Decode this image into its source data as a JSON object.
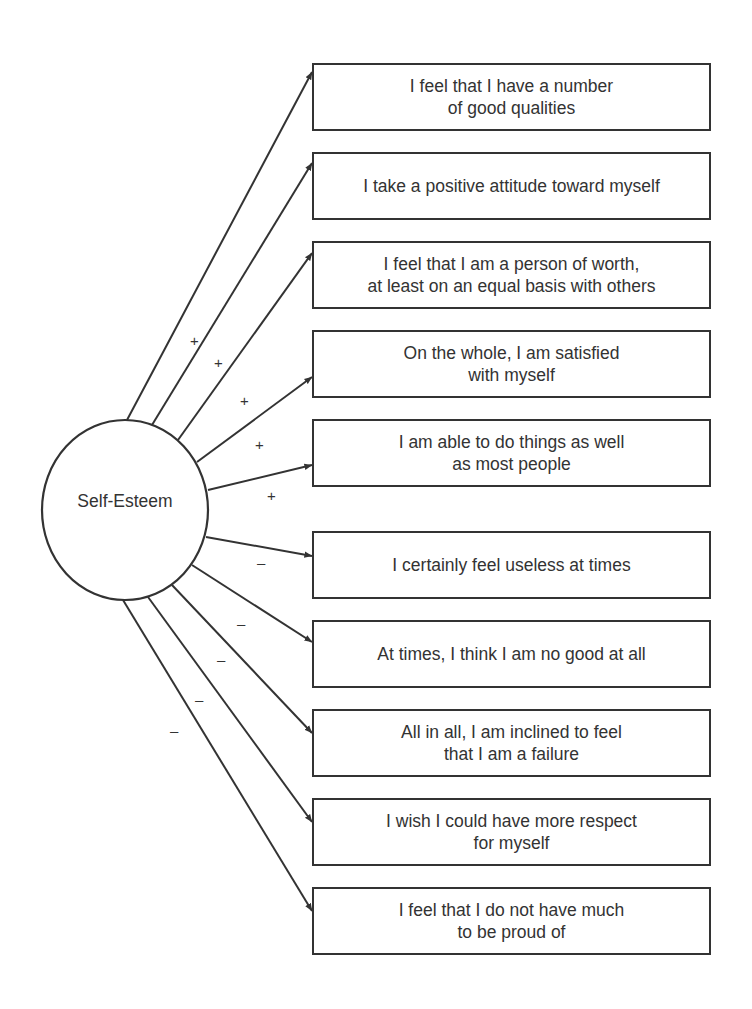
{
  "diagram": {
    "type": "measurement-model",
    "latent_factor": {
      "label": "Self-Esteem",
      "shape": "circle",
      "center": [
        125,
        510
      ],
      "radius": [
        83,
        90
      ]
    },
    "colors": {
      "line": "#333333",
      "background": "#ffffff",
      "text": "#333333"
    },
    "items": [
      {
        "text": "I feel that I have a number\nof good qualities",
        "sign": "+",
        "top": 63,
        "from": [
          127,
          420
        ],
        "to": [
          312,
          72
        ],
        "sign_pos": [
          190,
          333
        ]
      },
      {
        "text": "I take a positive attitude toward myself",
        "sign": "+",
        "top": 152,
        "from": [
          152,
          425
        ],
        "to": [
          312,
          163
        ],
        "sign_pos": [
          214,
          355
        ]
      },
      {
        "text": "I feel that I am a person of worth,\nat least on an equal basis with others",
        "sign": "+",
        "top": 241,
        "from": [
          178,
          440
        ],
        "to": [
          312,
          253
        ],
        "sign_pos": [
          240,
          393
        ]
      },
      {
        "text": "On the whole, I am satisfied\nwith myself",
        "sign": "+",
        "top": 330,
        "from": [
          197,
          462
        ],
        "to": [
          312,
          377
        ],
        "sign_pos": [
          255,
          437
        ]
      },
      {
        "text": "I am able to do things as well\nas most people",
        "sign": "+",
        "top": 419,
        "from": [
          208,
          490
        ],
        "to": [
          312,
          465
        ],
        "sign_pos": [
          267,
          488
        ]
      },
      {
        "text": "I certainly feel useless at times",
        "sign": "–",
        "top": 531,
        "from": [
          206,
          537
        ],
        "to": [
          312,
          556
        ],
        "sign_pos": [
          257,
          555
        ]
      },
      {
        "text": "At times, I think I am no good at all",
        "sign": "–",
        "top": 620,
        "from": [
          192,
          565
        ],
        "to": [
          312,
          642
        ],
        "sign_pos": [
          237,
          616
        ]
      },
      {
        "text": "All in all, I am inclined to feel\nthat I am a failure",
        "sign": "–",
        "top": 709,
        "from": [
          172,
          585
        ],
        "to": [
          312,
          733
        ],
        "sign_pos": [
          217,
          652
        ]
      },
      {
        "text": "I wish I could have more respect\nfor myself",
        "sign": "–",
        "top": 798,
        "from": [
          148,
          597
        ],
        "to": [
          312,
          822
        ],
        "sign_pos": [
          195,
          692
        ]
      },
      {
        "text": "I feel that I do not have much\nto be proud of",
        "sign": "–",
        "top": 887,
        "from": [
          123,
          600
        ],
        "to": [
          312,
          911
        ],
        "sign_pos": [
          170,
          723
        ]
      }
    ]
  }
}
